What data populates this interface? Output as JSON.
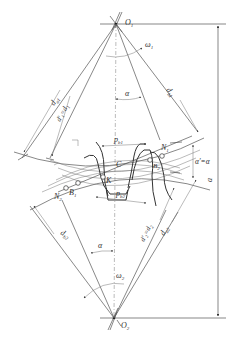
{
  "figure": {
    "type": "involute gear meshing diagram",
    "labels": {
      "O1": "O",
      "O1_sub": "1",
      "O2": "O",
      "O2_sub": "2",
      "omega1": "ω",
      "omega1_sub": "1",
      "omega2": "ω",
      "omega2_sub": "2",
      "alpha_top": "α",
      "alpha_bottom": "α",
      "da1": "d",
      "da1_sub": "a1",
      "d1_prime": "d′₁=d",
      "d1_prime_sub": "1",
      "db1": "d",
      "db1_sub": "b1",
      "pb1": "p",
      "pb1_sub": "b1",
      "pb2": "p",
      "pb2_sub": "b2",
      "N1": "N",
      "N1_sub": "1",
      "N2": "N",
      "N2_sub": "2",
      "B1": "B",
      "B1_sub": "1",
      "B2": "B",
      "B2_sub": "2",
      "K": "K",
      "C": "C",
      "alpha_prime_eq": "α′=α",
      "db2": "d",
      "db2_sub": "b2",
      "d2_prime": "d′₂=d",
      "d2_prime_sub": "2",
      "da2": "d",
      "da2_sub": "a2",
      "center_distance": "a"
    },
    "colors": {
      "line": "#555555",
      "text": "#333333",
      "background": "#ffffff"
    }
  }
}
